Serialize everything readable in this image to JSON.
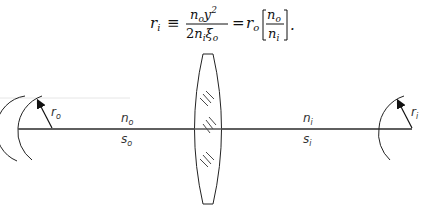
{
  "equation": {
    "lhs": "r",
    "lhs_sub": "i",
    "equiv": "≡",
    "frac1_num": "n",
    "frac1_num_sub": "o",
    "frac1_num_var": "y",
    "frac1_num_var_sub": "o",
    "frac1_num_var_sup": "2",
    "frac1_den_coef": "2",
    "frac1_den": "n",
    "frac1_den_sub": "i",
    "frac1_den_var": "ξ",
    "frac1_den_var_sub": "o",
    "eq": "=",
    "rhs": "r",
    "rhs_sub": "o",
    "frac2_num": "n",
    "frac2_num_sub": "o",
    "frac2_den": "n",
    "frac2_den_sub": "i",
    "period": "."
  },
  "labels": {
    "r_o": "r",
    "r_o_sub": "o",
    "n_o": "n",
    "n_o_sub": "o",
    "s_o": "s",
    "s_o_sub": "o",
    "n_i": "n",
    "n_i_sub": "i",
    "s_i": "s",
    "s_i_sub": "i",
    "r_i": "r",
    "r_i_sub": "i"
  },
  "colors": {
    "line": "#555555",
    "text": "#333333"
  }
}
